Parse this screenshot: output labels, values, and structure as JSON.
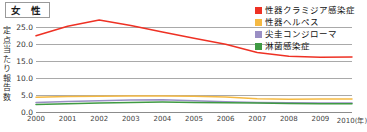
{
  "header": {
    "panel_title": "女 性"
  },
  "chart_data": {
    "type": "line",
    "title": "女 性",
    "xlabel": "(年)",
    "ylabel": "定点当たり報告数",
    "grid": true,
    "legend_position": "top-right",
    "categories": [
      "2000",
      "2001",
      "2002",
      "2003",
      "2004",
      "2005",
      "2006",
      "2007",
      "2008",
      "2009",
      "2010"
    ],
    "x_axis_unit": "(年)",
    "ylim": [
      0.0,
      27.5
    ],
    "yticks": [
      "0.0",
      "5.0",
      "10.0",
      "15.0",
      "20.0",
      "25.0"
    ],
    "ytick_values": [
      0.0,
      5.0,
      10.0,
      15.0,
      20.0,
      25.0
    ],
    "series": [
      {
        "name": "性器クラミジア感染症",
        "color": "#ee3124",
        "values": [
          22.3,
          25.1,
          26.9,
          25.3,
          23.4,
          21.6,
          19.8,
          17.4,
          16.3,
          16.0,
          16.1
        ]
      },
      {
        "name": "性器ヘルペス",
        "color": "#f5b942",
        "values": [
          4.3,
          4.5,
          4.6,
          4.7,
          4.7,
          4.6,
          4.4,
          3.9,
          3.7,
          3.8,
          3.8
        ]
      },
      {
        "name": "尖圭コンジローマ",
        "color": "#9a8fc4",
        "values": [
          2.8,
          3.1,
          3.3,
          3.5,
          3.6,
          3.3,
          3.0,
          2.8,
          2.7,
          2.6,
          2.6
        ]
      },
      {
        "name": "淋菌感染症",
        "color": "#3f9a43",
        "values": [
          2.2,
          2.4,
          2.6,
          2.8,
          2.9,
          2.8,
          2.7,
          2.6,
          2.5,
          2.4,
          2.4
        ]
      }
    ]
  }
}
